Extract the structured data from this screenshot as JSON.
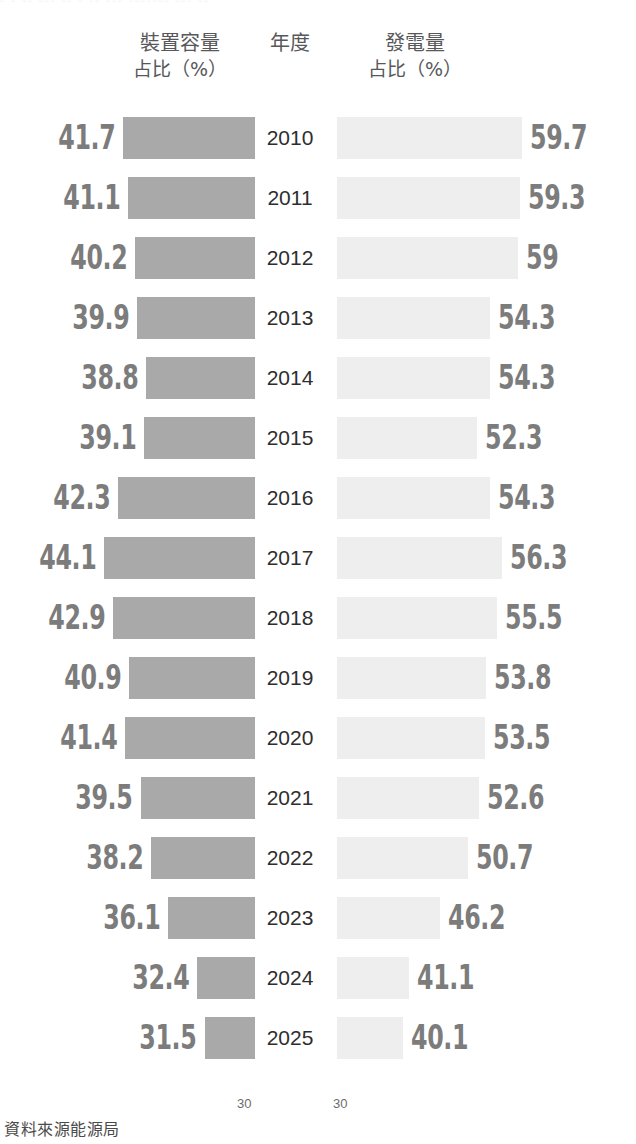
{
  "top_bleed_text": "▫ ▫ ▫▫ ▫▫▫ ▫▫ ▫  ▫▫ ▫▫▫ ▫▫▫▫▫▫▫   ▫▫▫  ▫▫",
  "header": {
    "left_line1": "裝置容量",
    "left_line2": "占比（%）",
    "year_label": "年度",
    "right_line1": "發電量",
    "right_line2": "占比（%）"
  },
  "axis": {
    "left_tick": "30",
    "right_tick": "30"
  },
  "footer": {
    "source": "資料來源能源局"
  },
  "colors": {
    "bar_left": "#a9a9a9",
    "bar_right": "#eeeeee",
    "value_label": "#7c7c7c",
    "year_label": "#2e2e2e",
    "header_text": "#58585a",
    "background": "#ffffff"
  },
  "chart_data": {
    "type": "bar",
    "subtitle": "",
    "orientation": "horizontal-bidirectional",
    "xlabel": "",
    "ylabel": "年度",
    "grid": false,
    "legend_position": "top",
    "categories": [
      "2010",
      "2011",
      "2012",
      "2013",
      "2014",
      "2015",
      "2016",
      "2017",
      "2018",
      "2019",
      "2020",
      "2021",
      "2022",
      "2023",
      "2024",
      "2025"
    ],
    "series": [
      {
        "name": "裝置容量占比（%）",
        "side": "left",
        "color": "#a9a9a9",
        "baseline": 30,
        "values": [
          41.7,
          41.1,
          40.2,
          39.9,
          38.8,
          39.1,
          42.3,
          44.1,
          42.9,
          40.9,
          41.4,
          39.5,
          38.2,
          36.1,
          32.4,
          31.5
        ],
        "labels": [
          "41.7",
          "41.1",
          "40.2",
          "39.9",
          "38.8",
          "39.1",
          "42.3",
          "44.1",
          "42.9",
          "40.9",
          "41.4",
          "39.5",
          "38.2",
          "36.1",
          "32.4",
          "31.5"
        ]
      },
      {
        "name": "發電量占比（%）",
        "side": "right",
        "color": "#eeeeee",
        "baseline": 30,
        "values": [
          59.7,
          59.3,
          59.0,
          54.3,
          54.3,
          52.3,
          54.3,
          56.3,
          55.5,
          53.8,
          53.5,
          52.6,
          50.7,
          46.2,
          41.1,
          40.1
        ],
        "labels": [
          "59.7",
          "59.3",
          "59",
          "54.3",
          "54.3",
          "52.3",
          "54.3",
          "56.3",
          "55.5",
          "53.8",
          "53.5",
          "52.6",
          "50.7",
          "46.2",
          "41.1",
          "40.1"
        ]
      }
    ],
    "source_note": "資料來源能源局"
  }
}
